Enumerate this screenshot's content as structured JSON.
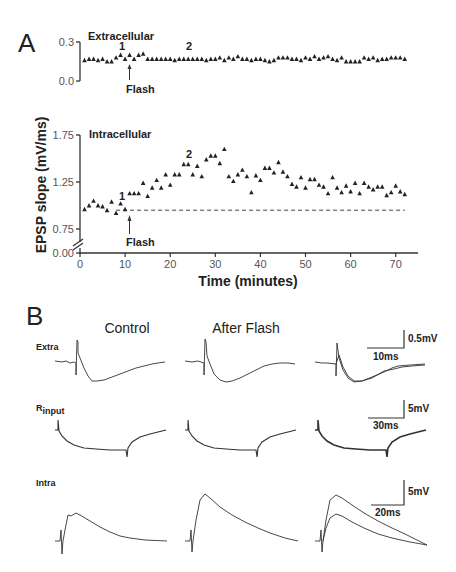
{
  "panels": {
    "A": {
      "label": "A"
    },
    "B": {
      "label": "B"
    }
  },
  "chart_data": [
    {
      "type": "scatter",
      "panel": "A-top",
      "title": "Extracellular",
      "xlabel": "Time (minutes)",
      "ylabel": "EPSP slope (mV/ms)",
      "yticks": [
        "0.0",
        "0.3"
      ],
      "ylim": [
        0.0,
        0.3
      ],
      "xlim": [
        0,
        75
      ],
      "marker": "triangle",
      "annotations": [
        {
          "text": "1",
          "x": 10
        },
        {
          "text": "2",
          "x": 25
        },
        {
          "text": "Flash",
          "x": 11,
          "type": "arrow"
        }
      ],
      "x": [
        1,
        2,
        3,
        4,
        5,
        6,
        7,
        8,
        9,
        10,
        11,
        12,
        13,
        14,
        15,
        16,
        17,
        18,
        19,
        20,
        21,
        22,
        23,
        24,
        25,
        26,
        27,
        28,
        29,
        30,
        31,
        32,
        33,
        34,
        35,
        36,
        37,
        38,
        39,
        40,
        41,
        42,
        43,
        44,
        45,
        46,
        47,
        48,
        49,
        50,
        51,
        52,
        53,
        54,
        55,
        56,
        57,
        58,
        59,
        60,
        61,
        62,
        63,
        64,
        65,
        66,
        67,
        68,
        69,
        70,
        71,
        72
      ],
      "y": [
        0.16,
        0.17,
        0.17,
        0.16,
        0.17,
        0.15,
        0.15,
        0.18,
        0.2,
        0.17,
        0.2,
        0.17,
        0.2,
        0.21,
        0.17,
        0.17,
        0.17,
        0.17,
        0.17,
        0.17,
        0.16,
        0.17,
        0.17,
        0.17,
        0.17,
        0.17,
        0.17,
        0.16,
        0.17,
        0.17,
        0.18,
        0.16,
        0.18,
        0.17,
        0.19,
        0.17,
        0.17,
        0.16,
        0.17,
        0.17,
        0.16,
        0.15,
        0.16,
        0.18,
        0.18,
        0.18,
        0.17,
        0.17,
        0.16,
        0.18,
        0.17,
        0.19,
        0.17,
        0.18,
        0.19,
        0.17,
        0.16,
        0.18,
        0.15,
        0.15,
        0.15,
        0.15,
        0.18,
        0.17,
        0.18,
        0.16,
        0.17,
        0.17,
        0.18,
        0.18,
        0.18,
        0.17
      ]
    },
    {
      "type": "scatter",
      "panel": "A-bottom",
      "title": "Intracellular",
      "xlabel": "Time (minutes)",
      "ylabel": "EPSP slope (mV/ms)",
      "xticks": [
        "0",
        "10",
        "20",
        "30",
        "40",
        "50",
        "60",
        "70"
      ],
      "yticks": [
        "0.00",
        "0.75",
        "1.25",
        "1.75"
      ],
      "ylim": [
        0.0,
        1.75
      ],
      "axis_break": true,
      "xlim": [
        0,
        75
      ],
      "marker": "triangle",
      "baseline": {
        "style": "dashed",
        "y": 0.95,
        "x_from": 8,
        "x_to": 72
      },
      "annotations": [
        {
          "text": "1",
          "x": 10
        },
        {
          "text": "2",
          "x": 25
        },
        {
          "text": "Flash",
          "x": 11,
          "type": "arrow"
        }
      ],
      "x": [
        1,
        2,
        3,
        4,
        5,
        6,
        7,
        8,
        9,
        10,
        11,
        12,
        13,
        14,
        15,
        16,
        17,
        18,
        19,
        20,
        21,
        22,
        23,
        24,
        25,
        26,
        27,
        28,
        29,
        30,
        31,
        32,
        33,
        34,
        35,
        36,
        37,
        38,
        39,
        40,
        41,
        42,
        43,
        44,
        45,
        46,
        47,
        48,
        49,
        50,
        51,
        52,
        53,
        54,
        55,
        56,
        57,
        58,
        59,
        60,
        61,
        62,
        63,
        64,
        65,
        66,
        67,
        68,
        69,
        70,
        71,
        72
      ],
      "y": [
        0.96,
        1.0,
        1.05,
        1.0,
        0.99,
        0.95,
        1.04,
        0.92,
        1.02,
        0.96,
        1.13,
        1.13,
        1.13,
        1.24,
        1.1,
        1.19,
        1.27,
        1.19,
        1.33,
        1.22,
        1.33,
        1.33,
        1.44,
        1.44,
        1.33,
        1.42,
        1.31,
        1.49,
        1.53,
        1.53,
        1.45,
        1.6,
        1.31,
        1.26,
        1.33,
        1.38,
        1.31,
        1.14,
        1.32,
        1.27,
        1.4,
        1.4,
        1.35,
        1.46,
        1.36,
        1.31,
        1.23,
        1.2,
        1.3,
        1.19,
        1.28,
        1.28,
        1.22,
        1.2,
        1.13,
        1.3,
        1.19,
        1.14,
        1.21,
        1.15,
        1.24,
        1.13,
        1.24,
        1.2,
        1.17,
        1.2,
        1.2,
        1.11,
        1.14,
        1.21,
        1.15,
        1.12
      ]
    },
    {
      "type": "line",
      "panel": "B",
      "column_titles": [
        "Control",
        "After Flash",
        ""
      ],
      "rows": [
        {
          "label": "Extra",
          "scale_bar": {
            "y": "0.5mV",
            "x": "10ms"
          },
          "overlay_in_third_column": true
        },
        {
          "label": "R",
          "label_sub": "input",
          "scale_bar": {
            "y": "5mV",
            "x": "30ms"
          },
          "overlay_in_third_column": true
        },
        {
          "label": "Intra",
          "scale_bar": {
            "y": "5mV",
            "x": "20ms"
          },
          "overlay_in_third_column": true
        }
      ]
    }
  ],
  "labels": {
    "extra_title": "Extracellular",
    "intra_title": "Intracellular",
    "ylabel": "EPSP slope (mV/ms)",
    "xlabel": "Time (minutes)",
    "flash": "Flash",
    "mark1": "1",
    "mark2": "2",
    "ext_ytick_top": "0.3",
    "ext_ytick_bot": "0.0",
    "int_yticks": [
      "1.75",
      "1.25",
      "0.75",
      "0.00"
    ],
    "xticks": [
      "0",
      "10",
      "20",
      "30",
      "40",
      "50",
      "60",
      "70"
    ],
    "col_control": "Control",
    "col_after": "After Flash",
    "row_extra": "Extra",
    "row_rinput_main": "R",
    "row_rinput_sub": "input",
    "row_intra": "Intra",
    "sb_extra_y": "0.5mV",
    "sb_extra_x": "10ms",
    "sb_rin_y": "5mV",
    "sb_rin_x": "30ms",
    "sb_intra_y": "5mV",
    "sb_intra_x": "20ms"
  },
  "colors": {
    "ink": "#222222",
    "background": "#ffffff"
  }
}
